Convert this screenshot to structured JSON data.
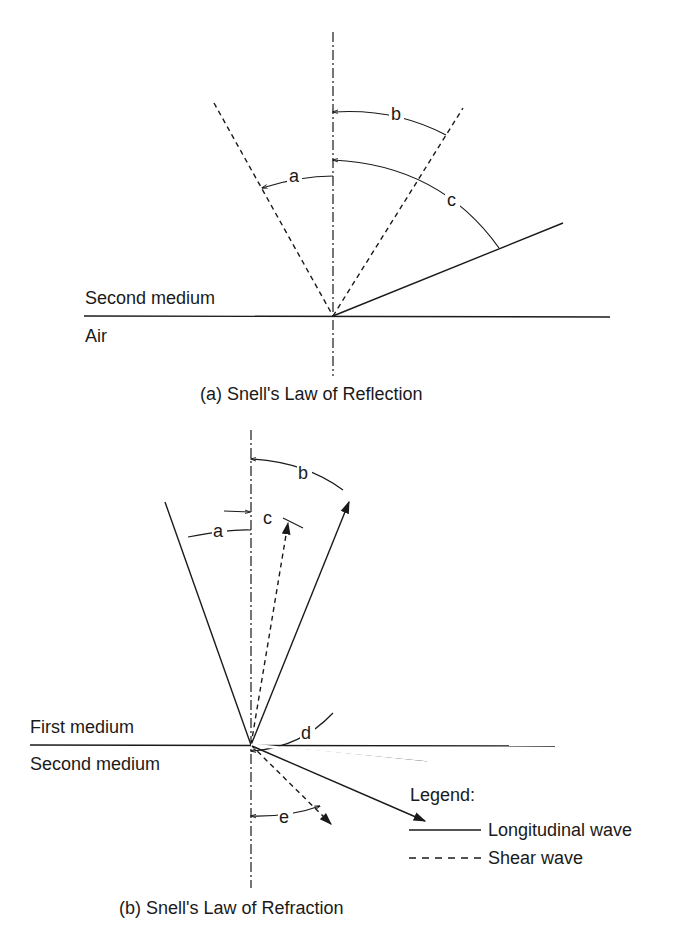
{
  "reflection": {
    "caption": "(a) Snell's Law of Reflection",
    "upper_medium": "Second medium",
    "lower_medium": "Air",
    "angles": {
      "a": "a",
      "b": "b",
      "c": "c"
    }
  },
  "refraction": {
    "caption": "(b) Snell's Law of Refraction",
    "upper_medium": "First medium",
    "lower_medium": "Second medium",
    "angles": {
      "a": "a",
      "b": "b",
      "c": "c",
      "d": "d",
      "e": "e"
    }
  },
  "legend": {
    "title": "Legend:",
    "items": [
      {
        "label": "Longitudinal wave",
        "style": "solid"
      },
      {
        "label": "Shear wave",
        "style": "dashed"
      }
    ]
  },
  "colors": {
    "line": "#1a1a1a",
    "background": "#ffffff"
  }
}
